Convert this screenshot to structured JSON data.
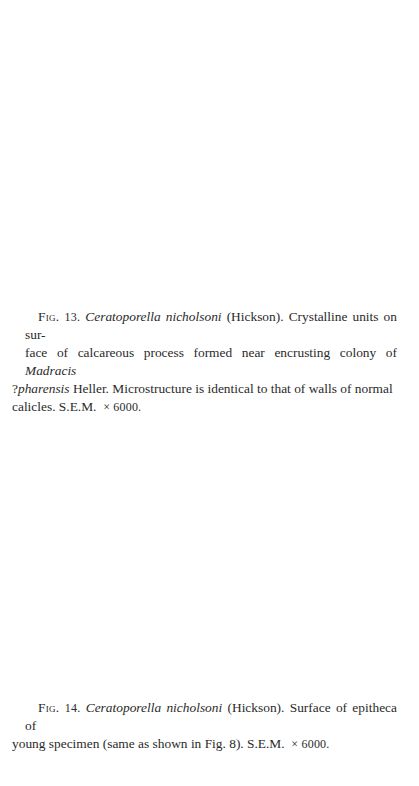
{
  "page": {
    "background": "#ffffff",
    "text_color": "#2a2a2a"
  },
  "captions": [
    {
      "label": "Fig. 13.",
      "label_prefix": "Fig.",
      "label_number": "13.",
      "species": "Ceratoporella nicholsoni",
      "authority": " (Hickson). Crystalline units on sur-face of calcareous process formed near encrusting colony of ",
      "taxon2": "Madracis ?pharensis",
      "taxon2_prefix": "Madracis",
      "taxon2_q": "?",
      "taxon2_epithet": "pharensis",
      "text_after_taxon2": " Heller. Microstructure is identical to that of walls of normal calicles. S.E.M. ",
      "magnification": "× 6000."
    },
    {
      "label": "Fig. 14.",
      "label_prefix": "Fig.",
      "label_number": "14.",
      "species": "Ceratoporella nicholsoni",
      "text": " (Hickson). Surface of epitheca of young specimen (same as shown in Fig. 8). S.E.M. ",
      "magnification": "× 6000."
    }
  ],
  "fig13": {
    "line1_pre": " (Hickson). Crystalline units on sur-",
    "line2": "face of calcareous process formed near encrusting colony of ",
    "line2_it": "Madracis",
    "line3_q": "?",
    "line3_it": "pharensis",
    "line3": " Heller. Microstructure is identical to that of walls of normal",
    "line4": "calicles. S.E.M. "
  },
  "fig14": {
    "line1": " (Hickson). Surface of epitheca of",
    "line2": "young specimen (same as shown in Fig. 8). S.E.M. "
  }
}
